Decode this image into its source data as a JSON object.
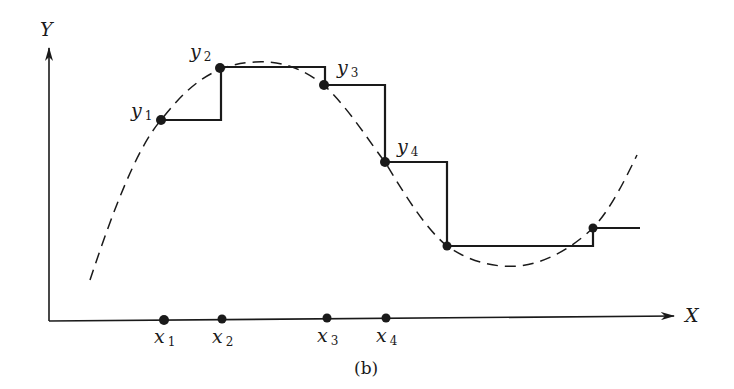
{
  "figure": {
    "caption": "(b)",
    "axes": {
      "x_label": "X",
      "y_label": "Y"
    },
    "sample_labels_y": [
      {
        "base": "y",
        "sub": "1"
      },
      {
        "base": "y",
        "sub": "2"
      },
      {
        "base": "y",
        "sub": "3"
      },
      {
        "base": "y",
        "sub": "4"
      }
    ],
    "sample_labels_x": [
      {
        "base": "x",
        "sub": "1"
      },
      {
        "base": "x",
        "sub": "2"
      },
      {
        "base": "x",
        "sub": "3"
      },
      {
        "base": "x",
        "sub": "4"
      }
    ],
    "colors": {
      "ink": "#1a1a1a",
      "background": "#ffffff"
    }
  }
}
